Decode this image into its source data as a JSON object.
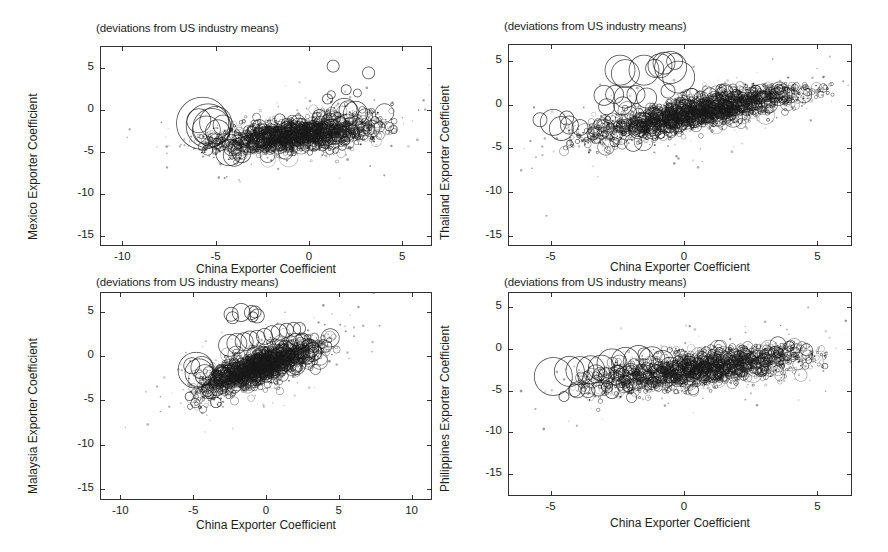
{
  "figure": {
    "background": "#ffffff",
    "ink": "#1d1d1d",
    "width": 888,
    "height": 552
  },
  "chart_data": [
    {
      "type": "scatter",
      "id": "mexico",
      "title": "(deviations from US industry means)",
      "xlabel": "China Exporter Coefficient",
      "ylabel": "Mexico Exporter Coefficient",
      "xlim": [
        -11.2,
        6.6
      ],
      "ylim": [
        -16.2,
        7.6
      ],
      "xticks": [
        -10,
        -5,
        0,
        5
      ],
      "xticklabels": [
        "-10",
        "-5",
        "0",
        "5"
      ],
      "yticks": [
        5,
        0,
        -5,
        -10,
        -15
      ],
      "yticklabels": [
        "5",
        "0",
        "-5",
        "-10",
        "-15"
      ],
      "grid": false,
      "legend": null,
      "marker": "open-circle",
      "n_points": 2200,
      "cloud": {
        "x_center": -0.6,
        "y_center": -3.0,
        "x_spread": 2.1,
        "y_spread": 0.95,
        "slope": 0.22,
        "x_min": -6.9,
        "x_max": 4.6,
        "y_min": -7.4,
        "y_max": 1.2
      },
      "big_bubbles": [
        {
          "x": -5.7,
          "y": -1.6,
          "r": 26
        },
        {
          "x": -5.4,
          "y": -1.9,
          "r": 22
        },
        {
          "x": -5.2,
          "y": -2.1,
          "r": 19
        },
        {
          "x": -5.0,
          "y": -1.5,
          "r": 16
        },
        {
          "x": -5.5,
          "y": -2.4,
          "r": 14
        },
        {
          "x": -4.9,
          "y": -2.6,
          "r": 12
        },
        {
          "x": -5.9,
          "y": -1.3,
          "r": 12
        },
        {
          "x": -4.6,
          "y": -1.8,
          "r": 10
        },
        {
          "x": -4.3,
          "y": -5.1,
          "r": 13
        },
        {
          "x": -4.0,
          "y": -5.4,
          "r": 11
        },
        {
          "x": -3.6,
          "y": -5.2,
          "r": 9
        },
        {
          "x": 1.9,
          "y": -0.3,
          "r": 14
        },
        {
          "x": 2.5,
          "y": -0.4,
          "r": 12
        },
        {
          "x": 2.1,
          "y": 0.0,
          "r": 9
        },
        {
          "x": 1.3,
          "y": 5.2,
          "r": 6
        },
        {
          "x": 3.2,
          "y": 4.4,
          "r": 6
        },
        {
          "x": 2.0,
          "y": 2.4,
          "r": 5
        },
        {
          "x": 1.2,
          "y": 1.8,
          "r": 4
        },
        {
          "x": 2.6,
          "y": 2.0,
          "r": 4
        },
        {
          "x": 1.0,
          "y": 1.3,
          "r": 5
        }
      ]
    },
    {
      "type": "scatter",
      "id": "thailand",
      "title": "(deviations from US industry means)",
      "xlabel": "China Exporter Coefficient",
      "ylabel": "Thailand Exporter Coefficient",
      "xlim": [
        -6.6,
        6.3
      ],
      "ylim": [
        -16.2,
        7.0
      ],
      "xticks": [
        -5,
        0,
        5
      ],
      "xticklabels": [
        "-5",
        "0",
        "5"
      ],
      "yticks": [
        5,
        0,
        -5,
        -10,
        -15
      ],
      "yticklabels": [
        "5",
        "0",
        "-5",
        "-10",
        "-15"
      ],
      "grid": false,
      "legend": null,
      "marker": "open-circle",
      "n_points": 2600,
      "cloud": {
        "x_center": 0.6,
        "y_center": -0.8,
        "x_spread": 2.0,
        "y_spread": 0.9,
        "slope": 0.62,
        "x_min": -4.6,
        "x_max": 5.6,
        "y_min": -6.6,
        "y_max": 2.5
      },
      "big_bubbles": [
        {
          "x": -2.4,
          "y": 4.0,
          "r": 15
        },
        {
          "x": -2.2,
          "y": 3.6,
          "r": 14
        },
        {
          "x": -1.5,
          "y": 4.0,
          "r": 15
        },
        {
          "x": -0.9,
          "y": 4.5,
          "r": 12
        },
        {
          "x": -0.75,
          "y": 4.8,
          "r": 11
        },
        {
          "x": -0.5,
          "y": 4.3,
          "r": 16
        },
        {
          "x": -0.2,
          "y": 3.2,
          "r": 16
        },
        {
          "x": -1.1,
          "y": 4.2,
          "r": 9
        },
        {
          "x": -0.35,
          "y": 5.0,
          "r": 8
        },
        {
          "x": -3.0,
          "y": 1.1,
          "r": 10
        },
        {
          "x": -2.6,
          "y": 1.2,
          "r": 9
        },
        {
          "x": -2.2,
          "y": 0.9,
          "r": 11
        },
        {
          "x": -1.8,
          "y": 1.2,
          "r": 9
        },
        {
          "x": -1.4,
          "y": 0.8,
          "r": 10
        },
        {
          "x": -2.9,
          "y": -0.2,
          "r": 8
        },
        {
          "x": -2.3,
          "y": -0.1,
          "r": 9
        },
        {
          "x": -4.4,
          "y": -1.5,
          "r": 7
        },
        {
          "x": -4.9,
          "y": -2.0,
          "r": 13
        },
        {
          "x": -4.6,
          "y": -2.7,
          "r": 12
        },
        {
          "x": -4.3,
          "y": -2.3,
          "r": 9
        },
        {
          "x": -3.9,
          "y": -2.6,
          "r": 8
        },
        {
          "x": -5.4,
          "y": -1.7,
          "r": 7
        },
        {
          "x": -0.6,
          "y": 1.6,
          "r": 7
        },
        {
          "x": 0.3,
          "y": 1.2,
          "r": 6
        },
        {
          "x": 1.4,
          "y": 1.3,
          "r": 6
        }
      ]
    },
    {
      "type": "scatter",
      "id": "malaysia",
      "title": "(deviations from US industry means)",
      "xlabel": "China Exporter Coefficient",
      "ylabel": "Malaysia Exporter Coefficient",
      "xlim": [
        -11.4,
        11.4
      ],
      "ylim": [
        -16.2,
        7.2
      ],
      "xticks": [
        -10,
        -5,
        0,
        5,
        10
      ],
      "xticklabels": [
        "-10",
        "-5",
        "0",
        "5",
        "10"
      ],
      "yticks": [
        5,
        0,
        -5,
        -10,
        -15
      ],
      "yticklabels": [
        "5",
        "0",
        "-5",
        "-10",
        "-15"
      ],
      "grid": false,
      "legend": null,
      "marker": "open-circle",
      "n_points": 2400,
      "cloud": {
        "x_center": -0.4,
        "y_center": -1.2,
        "x_spread": 2.0,
        "y_spread": 0.95,
        "slope": 0.56,
        "x_min": -5.4,
        "x_max": 5.0,
        "y_min": -6.4,
        "y_max": 2.6
      },
      "big_bubbles": [
        {
          "x": -2.4,
          "y": 4.7,
          "r": 7
        },
        {
          "x": -2.3,
          "y": 4.3,
          "r": 6
        },
        {
          "x": -1.7,
          "y": 4.9,
          "r": 9
        },
        {
          "x": -1.0,
          "y": 4.9,
          "r": 7
        },
        {
          "x": -0.75,
          "y": 4.95,
          "r": 6
        },
        {
          "x": -0.6,
          "y": 4.5,
          "r": 7
        },
        {
          "x": -0.9,
          "y": 4.4,
          "r": 5
        },
        {
          "x": -2.5,
          "y": 1.2,
          "r": 11
        },
        {
          "x": -2.0,
          "y": 1.4,
          "r": 10
        },
        {
          "x": -1.5,
          "y": 1.6,
          "r": 9
        },
        {
          "x": -1.1,
          "y": 1.8,
          "r": 9
        },
        {
          "x": -0.6,
          "y": 2.0,
          "r": 8
        },
        {
          "x": -0.1,
          "y": 2.2,
          "r": 8
        },
        {
          "x": 0.4,
          "y": 2.5,
          "r": 8
        },
        {
          "x": 0.9,
          "y": 2.7,
          "r": 8
        },
        {
          "x": 1.4,
          "y": 2.9,
          "r": 7
        },
        {
          "x": 1.9,
          "y": 3.0,
          "r": 7
        },
        {
          "x": 2.3,
          "y": 3.1,
          "r": 6
        },
        {
          "x": -4.8,
          "y": -1.6,
          "r": 18
        },
        {
          "x": -4.6,
          "y": -1.9,
          "r": 14
        },
        {
          "x": -4.4,
          "y": -1.3,
          "r": 11
        },
        {
          "x": -4.2,
          "y": -2.1,
          "r": 10
        },
        {
          "x": -5.1,
          "y": -1.1,
          "r": 8
        },
        {
          "x": 2.0,
          "y": 1.5,
          "r": 9
        },
        {
          "x": 2.5,
          "y": 1.8,
          "r": 7
        }
      ]
    },
    {
      "type": "scatter",
      "id": "philippines",
      "title": "(deviations from US industry means)",
      "xlabel": "China Exporter Coefficient",
      "ylabel": "Philippines Exporter Coefficient",
      "xlim": [
        -6.6,
        6.3
      ],
      "ylim": [
        -17.6,
        6.8
      ],
      "xticks": [
        -5,
        0,
        5
      ],
      "xticklabels": [
        "-5",
        "0",
        "5"
      ],
      "yticks": [
        5,
        0,
        -5,
        -10,
        -15
      ],
      "yticklabels": [
        "5",
        "0",
        "-5",
        "-10",
        "-15"
      ],
      "grid": false,
      "legend": null,
      "marker": "open-circle",
      "n_points": 2100,
      "cloud": {
        "x_center": 0.7,
        "y_center": -2.3,
        "x_spread": 2.0,
        "y_spread": 1.0,
        "slope": 0.4,
        "x_min": -4.2,
        "x_max": 5.4,
        "y_min": -8.0,
        "y_max": 0.6
      },
      "big_bubbles": [
        {
          "x": -4.9,
          "y": -3.3,
          "r": 19
        },
        {
          "x": -4.3,
          "y": -2.7,
          "r": 15
        },
        {
          "x": -3.9,
          "y": -2.6,
          "r": 14
        },
        {
          "x": -3.5,
          "y": -2.5,
          "r": 14
        },
        {
          "x": -3.1,
          "y": -2.3,
          "r": 13
        },
        {
          "x": -2.7,
          "y": -1.8,
          "r": 15
        },
        {
          "x": -2.2,
          "y": -1.5,
          "r": 14
        },
        {
          "x": -1.7,
          "y": -1.4,
          "r": 15
        },
        {
          "x": -1.2,
          "y": -1.3,
          "r": 13
        },
        {
          "x": -0.8,
          "y": -1.5,
          "r": 11
        },
        {
          "x": -3.3,
          "y": -3.0,
          "r": 9
        },
        {
          "x": -2.9,
          "y": -3.2,
          "r": 8
        },
        {
          "x": -2.5,
          "y": -2.9,
          "r": 8
        },
        {
          "x": -2.0,
          "y": -2.7,
          "r": 8
        },
        {
          "x": -4.0,
          "y": -4.9,
          "r": 8
        },
        {
          "x": -3.6,
          "y": -5.0,
          "r": 7
        },
        {
          "x": -3.2,
          "y": -4.8,
          "r": 7
        },
        {
          "x": -2.7,
          "y": -5.1,
          "r": 7
        },
        {
          "x": -4.5,
          "y": -5.7,
          "r": 5
        },
        {
          "x": -1.5,
          "y": -0.6,
          "r": 6
        }
      ]
    }
  ],
  "panels": [
    {
      "name": "panel-mexico",
      "left": 100,
      "top": 46,
      "width": 332,
      "height": 200,
      "title_left": 96,
      "title_top": 22,
      "xlabel_center": 266,
      "xlabel_top": 262,
      "ylabel_left": 26,
      "ylabel_bottom": 240
    },
    {
      "name": "panel-thailand",
      "left": 508,
      "top": 44,
      "width": 344,
      "height": 202,
      "title_left": 504,
      "title_top": 20,
      "xlabel_center": 680,
      "xlabel_top": 260,
      "ylabel_left": 438,
      "ylabel_bottom": 240
    },
    {
      "name": "panel-malaysia",
      "left": 100,
      "top": 292,
      "width": 332,
      "height": 208,
      "title_left": 96,
      "title_top": 276,
      "xlabel_center": 266,
      "xlabel_top": 518,
      "ylabel_left": 26,
      "ylabel_bottom": 494
    },
    {
      "name": "panel-philippines",
      "left": 508,
      "top": 292,
      "width": 344,
      "height": 204,
      "title_left": 504,
      "title_top": 276,
      "xlabel_center": 680,
      "xlabel_top": 516,
      "ylabel_left": 438,
      "ylabel_bottom": 492
    }
  ]
}
